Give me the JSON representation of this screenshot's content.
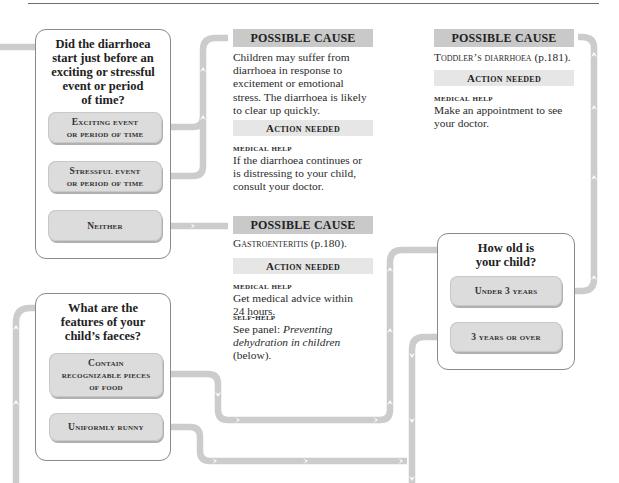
{
  "colors": {
    "connector": "#cccccc",
    "cause_header_bg": "#c9c9c9",
    "action_header_bg": "#e6e6e6",
    "option_bg": "#dcdcdc",
    "box_border": "#8a8a8a",
    "rule": "#6e6e6e"
  },
  "icons": {
    "connector_arrow": "chevron-arrow",
    "flow_line": "rounded-pipe"
  },
  "question1": {
    "title_lines": [
      "Did the diarrhoea",
      "start just before an",
      "exciting or stressful",
      "event or period",
      "of time?"
    ],
    "options": [
      {
        "line1": "Exciting event",
        "line2": "or period of time"
      },
      {
        "line1": "Stressful event",
        "line2": "or period of time"
      },
      {
        "line1": "Neither",
        "line2": ""
      }
    ]
  },
  "cause1": {
    "header": "POSSIBLE CAUSE",
    "body_lines": [
      "Children may suffer from",
      "diarrhoea in response to",
      "excitement or emotional",
      "stress. The diarrhoea is likely",
      "to clear up quickly."
    ],
    "action_header": "Action needed",
    "actions": [
      {
        "label": "medical help",
        "lines": [
          "If the diarrhoea continues or",
          "is distressing to your child,",
          "consult your doctor."
        ]
      }
    ]
  },
  "cause2": {
    "header": "POSSIBLE CAUSE",
    "diagnosis": "Gastroenteritis",
    "page_ref": " (p.180).",
    "action_header": "Action needed",
    "actions": [
      {
        "label": "medical help",
        "lines": [
          "Get medical advice within",
          "24 hours."
        ]
      },
      {
        "label": "self-help",
        "prefix": "See panel: ",
        "italic1": "Preventing",
        "italic2": "dehydration in children",
        "suffix": "(below)."
      }
    ]
  },
  "cause3": {
    "header": "POSSIBLE CAUSE",
    "diagnosis": "Toddler’s diarrhoea",
    "page_ref": " (p.181).",
    "action_header": "Action needed",
    "actions": [
      {
        "label": "medical help",
        "lines": [
          "Make an appointment to see",
          "your doctor."
        ]
      }
    ]
  },
  "question2": {
    "title_lines": [
      "What are the",
      "features of your",
      "child’s faeces?"
    ],
    "options": [
      {
        "line1": "Contain",
        "line2": "recognizable pieces",
        "line3": "of food"
      },
      {
        "line1": "Uniformly runny"
      }
    ]
  },
  "question3": {
    "title_lines": [
      "How old is",
      "your child?"
    ],
    "options": [
      {
        "line1": "Under 3 years"
      },
      {
        "line1": "3 years or over"
      }
    ]
  }
}
